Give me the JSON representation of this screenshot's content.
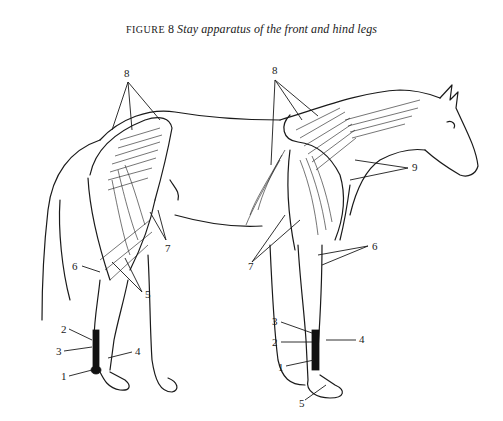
{
  "caption": {
    "label": "FIGURE",
    "number": "8",
    "title": "Stay apparatus of the front and hind legs"
  },
  "figure": {
    "hind_leg_labels": [
      {
        "id": "8",
        "text": "8"
      },
      {
        "id": "7",
        "text": "7"
      },
      {
        "id": "6",
        "text": "6"
      },
      {
        "id": "5",
        "text": "5"
      },
      {
        "id": "4",
        "text": "4"
      },
      {
        "id": "3",
        "text": "3"
      },
      {
        "id": "2",
        "text": "2"
      },
      {
        "id": "1",
        "text": "1"
      }
    ],
    "front_leg_labels": [
      {
        "id": "8",
        "text": "8"
      },
      {
        "id": "9",
        "text": "9"
      },
      {
        "id": "7",
        "text": "7"
      },
      {
        "id": "6",
        "text": "6"
      },
      {
        "id": "4",
        "text": "4"
      },
      {
        "id": "3",
        "text": "3"
      },
      {
        "id": "2",
        "text": "2"
      },
      {
        "id": "1",
        "text": "1"
      },
      {
        "id": "5",
        "text": "5"
      }
    ]
  }
}
